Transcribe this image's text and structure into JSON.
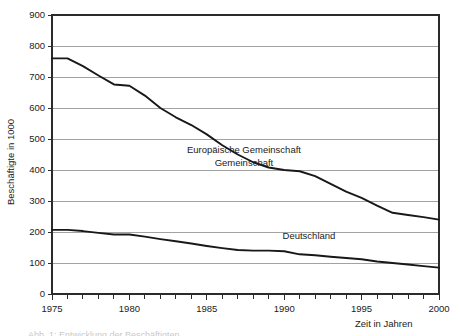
{
  "chart_data": {
    "type": "line",
    "title": "",
    "xlabel": "Zeit in Jahren",
    "ylabel": "Beschäftigte in 1000",
    "xlim": [
      1975,
      2000
    ],
    "ylim": [
      0,
      900
    ],
    "grid": true,
    "legend_position": "inline-annotation",
    "x_major_ticks": [
      1975,
      1980,
      1985,
      1990,
      1995,
      2000
    ],
    "x_major_tick_labels": [
      "1975",
      "1980",
      "1985",
      "1990",
      "1995",
      "2000"
    ],
    "x_minor_tick_step": 1,
    "y_ticks": [
      0,
      100,
      200,
      300,
      400,
      500,
      600,
      700,
      800,
      900
    ],
    "y_tick_labels": [
      "0",
      "100",
      "200",
      "300",
      "400",
      "500",
      "600",
      "700",
      "800",
      "900"
    ],
    "x": [
      1975,
      1976,
      1977,
      1978,
      1979,
      1980,
      1981,
      1982,
      1983,
      1984,
      1985,
      1986,
      1987,
      1988,
      1989,
      1990,
      1991,
      1992,
      1993,
      1994,
      1995,
      1996,
      1997,
      1998,
      1999,
      2000
    ],
    "series": [
      {
        "name": "Europäische Gemeinschaft",
        "values": [
          760,
          760,
          735,
          705,
          676,
          672,
          640,
          600,
          570,
          545,
          515,
          480,
          450,
          425,
          408,
          400,
          396,
          380,
          355,
          330,
          310,
          285,
          262,
          255,
          248,
          240
        ]
      },
      {
        "name": "Deutschland",
        "values": [
          207,
          207,
          203,
          197,
          192,
          192,
          185,
          177,
          170,
          163,
          155,
          148,
          142,
          140,
          140,
          138,
          128,
          125,
          120,
          116,
          112,
          105,
          100,
          95,
          90,
          85
        ]
      }
    ],
    "annotations": [
      {
        "id": "eg-label-line1",
        "text": "Europäische Gemeinschaft",
        "x": 1987.4,
        "y": 455
      },
      {
        "id": "eg-label-line2",
        "text": "Gemeinschaft",
        "x": 1987.4,
        "y": 412
      },
      {
        "id": "de-label",
        "text": "Deutschland",
        "x": 1991.6,
        "y": 178
      }
    ]
  },
  "footer": {
    "clipped_text": "Abb. 1: Entwicklung der Beschäftigten"
  }
}
